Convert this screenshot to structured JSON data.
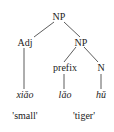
{
  "tree": {
    "root": "NP",
    "adj": "Adj",
    "np2": "NP",
    "prefix": "prefix",
    "n": "N",
    "words": [
      "xiǎo",
      "lǎo",
      "hǔ"
    ],
    "glosses": [
      "'small'",
      "'tiger'"
    ]
  }
}
